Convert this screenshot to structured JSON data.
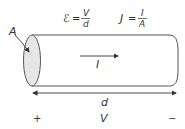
{
  "diagram": {
    "equations": {
      "field": {
        "lhs": "ℰ",
        "eq": "=",
        "num": "V",
        "den": "d"
      },
      "current_density": {
        "lhs": "J",
        "eq": "=",
        "num": "I",
        "den": "A"
      }
    },
    "labels": {
      "area": "A",
      "current": "I",
      "length": "d",
      "voltage": "V",
      "plus": "+",
      "minus": "−"
    },
    "colors": {
      "stroke": "#555555",
      "end_cap_fill": "#e6e6e6",
      "text": "#333333"
    }
  }
}
